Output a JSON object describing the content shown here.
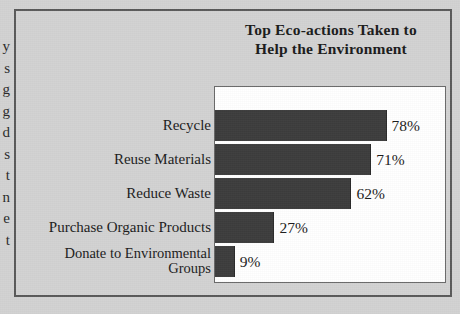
{
  "figure": {
    "title_lines": [
      "Top Eco-actions Taken to",
      "Help the Environment"
    ]
  },
  "margin_fragments": [
    "y",
    "s",
    "g",
    "g",
    "d",
    "s",
    "t",
    "n",
    "e",
    "t"
  ],
  "chart_data": {
    "type": "bar",
    "orientation": "horizontal",
    "title": "Top Eco-actions Taken to Help the Environment",
    "categories": [
      "Recycle",
      "Reuse Materials",
      "Reduce Waste",
      "Purchase Organic Products",
      "Donate to Environmental\nGroups"
    ],
    "values": [
      78,
      71,
      62,
      27,
      9
    ],
    "value_labels": [
      "78%",
      "71%",
      "62%",
      "27%",
      "9%"
    ],
    "xlabel": "",
    "ylabel": "",
    "xlim": [
      0,
      100
    ],
    "grid": false,
    "legend": false,
    "bar_color": "#3d3d3d",
    "plot_background": "#ffffff",
    "page_background": "#d3d3d3"
  }
}
